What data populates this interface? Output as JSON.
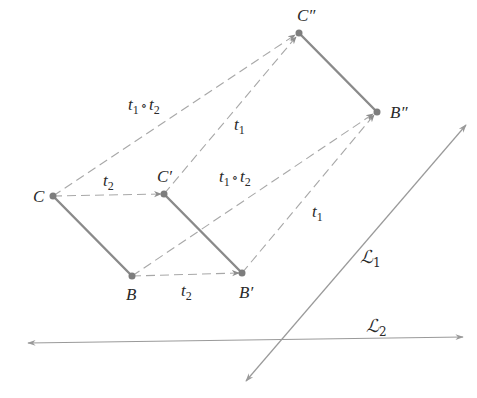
{
  "diagram": {
    "title": "",
    "colors": {
      "segment": "#8a8a8a",
      "dashed": "#a8a8a8",
      "line": "#9a9a9a",
      "point": "#7d7d7d",
      "text": "#2a2a2a"
    },
    "points": {
      "C": {
        "label": "C",
        "x": 53,
        "y": 196
      },
      "Cp": {
        "label": "C′",
        "x": 164,
        "y": 194
      },
      "B": {
        "label": "B",
        "x": 132,
        "y": 276
      },
      "Bp": {
        "label": "B′",
        "x": 242,
        "y": 273
      },
      "Cpp": {
        "label": "C″",
        "x": 299,
        "y": 33
      },
      "Bpp": {
        "label": "B″",
        "x": 377,
        "y": 112
      }
    },
    "labels": {
      "t2_top": {
        "base": "t",
        "sub": "2"
      },
      "t2_bottom": {
        "base": "t",
        "sub": "2"
      },
      "t1_upper": {
        "base": "t",
        "sub": "1"
      },
      "t1_lower": {
        "base": "t",
        "sub": "1"
      },
      "comp_upper": {
        "a": "t",
        "a_sub": "1",
        "op": "∘",
        "b": "t",
        "b_sub": "2"
      },
      "comp_lower": {
        "a": "t",
        "a_sub": "1",
        "op": "∘",
        "b": "t",
        "b_sub": "2"
      },
      "L1": {
        "base": "ℒ",
        "sub": "1"
      },
      "L2": {
        "base": "ℒ",
        "sub": "2"
      }
    },
    "segments": [
      {
        "name": "CB",
        "from": "C",
        "to": "B",
        "style": "solid"
      },
      {
        "name": "C'B'",
        "from": "Cp",
        "to": "Bp",
        "style": "solid"
      },
      {
        "name": "C''B''",
        "from": "Cpp",
        "to": "Bpp",
        "style": "solid"
      }
    ],
    "arrows": [
      {
        "name": "t2 C to C'",
        "from": "C",
        "to": "Cp",
        "style": "dashed"
      },
      {
        "name": "t2 B to B'",
        "from": "B",
        "to": "Bp",
        "style": "dashed"
      },
      {
        "name": "t1 C' to C''",
        "from": "Cp",
        "to": "Cpp",
        "style": "dashed"
      },
      {
        "name": "t1 B' to B''",
        "from": "Bp",
        "to": "Bpp",
        "style": "dashed"
      },
      {
        "name": "t1∘t2 C to C''",
        "from": "C",
        "to": "Cpp",
        "style": "dashed"
      },
      {
        "name": "t1∘t2 B to B''",
        "from": "B",
        "to": "Bpp",
        "style": "dashed"
      }
    ],
    "lines": [
      {
        "name": "L1",
        "x1": 466,
        "y1": 125,
        "x2": 246,
        "y2": 381,
        "arrows": "both"
      },
      {
        "name": "L2",
        "x1": 28,
        "y1": 343,
        "x2": 463,
        "y2": 337,
        "arrows": "both"
      }
    ]
  }
}
